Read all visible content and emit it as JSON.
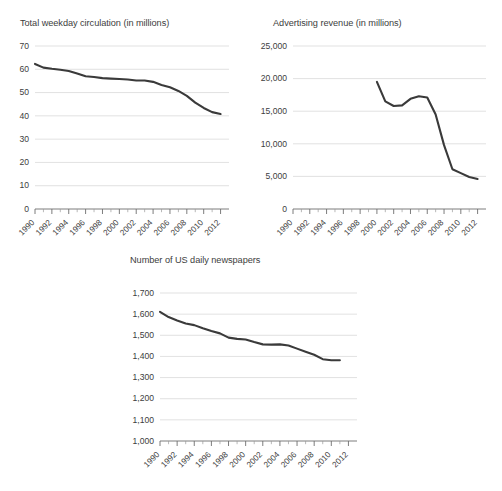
{
  "figure": {
    "background_color": "#ffffff",
    "line_color": "#3a3a3a",
    "grid_color": "#d9d9d9",
    "text_color": "#3d3d3d"
  },
  "panels": [
    {
      "id": "circulation",
      "title": "Total weekday circulation (in millions)"
    },
    {
      "id": "adrevenue",
      "title": "Advertising revenue (in millions)"
    },
    {
      "id": "newspapers",
      "title": "Number of US daily newspapers"
    }
  ],
  "chart_data": [
    {
      "type": "line",
      "title": "Total weekday circulation (in millions)",
      "xlabel": "",
      "ylabel": "",
      "xlim": [
        1990,
        2013
      ],
      "ylim": [
        0,
        70
      ],
      "grid": true,
      "legend": "none",
      "ytick_labels": [
        "70",
        "60",
        "50",
        "40",
        "30",
        "20",
        "10",
        "0"
      ],
      "ytick_values": [
        70,
        60,
        50,
        40,
        30,
        20,
        10,
        0
      ],
      "xtick_labels": [
        "1990",
        "1992",
        "1994",
        "1996",
        "1998",
        "2000",
        "2002",
        "2004",
        "2006",
        "2008",
        "2010",
        "2012"
      ],
      "xtick_values": [
        1990,
        1992,
        1994,
        1996,
        1998,
        2000,
        2002,
        2004,
        2006,
        2008,
        2010,
        2012
      ],
      "x": [
        1990,
        1991,
        1992,
        1993,
        1994,
        1995,
        1996,
        1997,
        1998,
        1999,
        2000,
        2001,
        2002,
        2003,
        2004,
        2005,
        2006,
        2007,
        2008,
        2009,
        2010,
        2011,
        2012
      ],
      "values": [
        62.3,
        60.7,
        60.2,
        59.8,
        59.3,
        58.2,
        57.0,
        56.7,
        56.2,
        56.0,
        55.8,
        55.6,
        55.2,
        55.2,
        54.6,
        53.3,
        52.3,
        50.7,
        48.6,
        45.7,
        43.4,
        41.6,
        40.8
      ]
    },
    {
      "type": "line",
      "title": "Advertising revenue (in millions)",
      "xlabel": "",
      "ylabel": "",
      "xlim": [
        1990,
        2013
      ],
      "ylim": [
        0,
        25000
      ],
      "grid": true,
      "legend": "none",
      "ytick_labels": [
        "25,000",
        "20,000",
        "15,000",
        "10,000",
        "5,000",
        "0"
      ],
      "ytick_values": [
        25000,
        20000,
        15000,
        10000,
        5000,
        0
      ],
      "xtick_labels": [
        "1990",
        "1992",
        "1994",
        "1996",
        "1998",
        "2000",
        "2002",
        "2004",
        "2006",
        "2008",
        "2010",
        "2012"
      ],
      "xtick_values": [
        1990,
        1992,
        1994,
        1996,
        1998,
        2000,
        2002,
        2004,
        2006,
        2008,
        2010,
        2012
      ],
      "x": [
        2000,
        2001,
        2002,
        2003,
        2004,
        2005,
        2006,
        2007,
        2008,
        2009,
        2010,
        2011,
        2012
      ],
      "values": [
        19500,
        16500,
        15800,
        15900,
        16900,
        17300,
        17100,
        14500,
        9800,
        6100,
        5500,
        4900,
        4600
      ]
    },
    {
      "type": "line",
      "title": "Number of US daily newspapers",
      "xlabel": "",
      "ylabel": "",
      "xlim": [
        1990,
        2013
      ],
      "ylim": [
        1000,
        1700
      ],
      "grid": true,
      "legend": "none",
      "ytick_labels": [
        "1,700",
        "1,600",
        "1,500",
        "1,400",
        "1,300",
        "1,200",
        "1,100",
        "1,000"
      ],
      "ytick_values": [
        1700,
        1600,
        1500,
        1400,
        1300,
        1200,
        1100,
        1000
      ],
      "xtick_labels": [
        "1990",
        "1992",
        "1994",
        "1996",
        "1998",
        "2000",
        "2002",
        "2004",
        "2006",
        "2008",
        "2010",
        "2012"
      ],
      "xtick_values": [
        1990,
        1992,
        1994,
        1996,
        1998,
        2000,
        2002,
        2004,
        2006,
        2008,
        2010,
        2012
      ],
      "x": [
        1990,
        1991,
        1992,
        1993,
        1994,
        1995,
        1996,
        1997,
        1998,
        1999,
        2000,
        2001,
        2002,
        2003,
        2004,
        2005,
        2006,
        2007,
        2008,
        2009,
        2010,
        2011
      ],
      "values": [
        1611,
        1586,
        1570,
        1556,
        1548,
        1533,
        1520,
        1509,
        1489,
        1483,
        1480,
        1468,
        1457,
        1456,
        1457,
        1452,
        1437,
        1422,
        1408,
        1387,
        1382,
        1382
      ]
    }
  ]
}
